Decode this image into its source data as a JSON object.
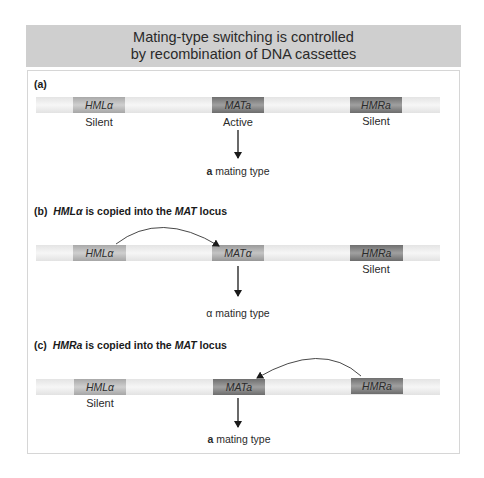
{
  "header": {
    "line1": "Mating-type switching is controlled",
    "line2": "by recombination of DNA cassettes"
  },
  "panels": [
    {
      "label": "(a)",
      "title": "",
      "cassettes": [
        {
          "name": "HMLα",
          "state": "Silent"
        },
        {
          "name": "MATa",
          "state": "Active"
        },
        {
          "name": "HMRa",
          "state": "Silent"
        }
      ],
      "result_bold": "a",
      "result_rest": " mating type"
    },
    {
      "label": "(b)",
      "title_italic": "HMLα",
      "title_mid": " is copied into the ",
      "title_italic2": "MAT",
      "title_end": " locus",
      "cassettes": [
        {
          "name": "HMLα",
          "state": ""
        },
        {
          "name": "MATα",
          "state": ""
        },
        {
          "name": "HMRa",
          "state": "Silent"
        }
      ],
      "result_bold": "α",
      "result_rest": " mating type"
    },
    {
      "label": "(c)",
      "title_italic": "HMRa",
      "title_mid": " is copied into the ",
      "title_italic2": "MAT",
      "title_end": " locus",
      "cassettes": [
        {
          "name": "HMLα",
          "state": "Silent"
        },
        {
          "name": "MATa",
          "state": ""
        },
        {
          "name": "HMRa",
          "state": ""
        }
      ],
      "result_bold": "a",
      "result_rest": " mating type"
    }
  ]
}
